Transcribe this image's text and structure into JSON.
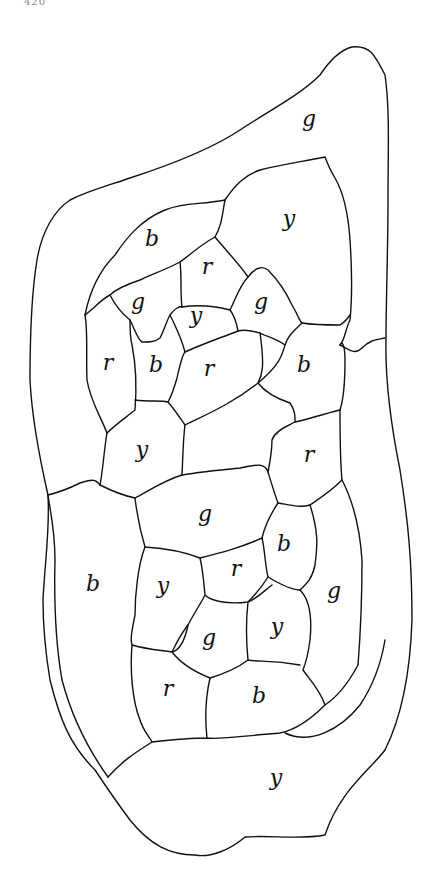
{
  "page": {
    "number": "420"
  },
  "figure": {
    "legend_codes": [
      "b",
      "g",
      "r",
      "y"
    ],
    "regions": [
      {
        "id": "outer-top",
        "label": "g",
        "x": 309,
        "y": 120
      },
      {
        "id": "top-right",
        "label": "y",
        "x": 289,
        "y": 220
      },
      {
        "id": "upper-left",
        "label": "b",
        "x": 152,
        "y": 240
      },
      {
        "id": "r1",
        "label": "r",
        "x": 207,
        "y": 268
      },
      {
        "id": "g1",
        "label": "g",
        "x": 138,
        "y": 303
      },
      {
        "id": "y1",
        "label": "y",
        "x": 196,
        "y": 317
      },
      {
        "id": "g2",
        "label": "g",
        "x": 261,
        "y": 303
      },
      {
        "id": "r2",
        "label": "r",
        "x": 108,
        "y": 364
      },
      {
        "id": "b1",
        "label": "b",
        "x": 156,
        "y": 366
      },
      {
        "id": "r3",
        "label": "r",
        "x": 209,
        "y": 370
      },
      {
        "id": "b2",
        "label": "b",
        "x": 304,
        "y": 366
      },
      {
        "id": "y2",
        "label": "y",
        "x": 142,
        "y": 451
      },
      {
        "id": "center",
        "label": "",
        "x": 238,
        "y": 440
      },
      {
        "id": "r4",
        "label": "r",
        "x": 309,
        "y": 456
      },
      {
        "id": "g3",
        "label": "g",
        "x": 205,
        "y": 515
      },
      {
        "id": "b3",
        "label": "b",
        "x": 284,
        "y": 545
      },
      {
        "id": "left-b",
        "label": "b",
        "x": 93,
        "y": 585
      },
      {
        "id": "y3",
        "label": "y",
        "x": 163,
        "y": 587
      },
      {
        "id": "r5",
        "label": "r",
        "x": 236,
        "y": 570
      },
      {
        "id": "g4",
        "label": "g",
        "x": 334,
        "y": 592
      },
      {
        "id": "g5",
        "label": "g",
        "x": 209,
        "y": 639
      },
      {
        "id": "y4",
        "label": "y",
        "x": 277,
        "y": 628
      },
      {
        "id": "r6",
        "label": "r",
        "x": 168,
        "y": 690
      },
      {
        "id": "b4",
        "label": "b",
        "x": 259,
        "y": 697
      },
      {
        "id": "bottom-y",
        "label": "y",
        "x": 276,
        "y": 779
      }
    ]
  }
}
